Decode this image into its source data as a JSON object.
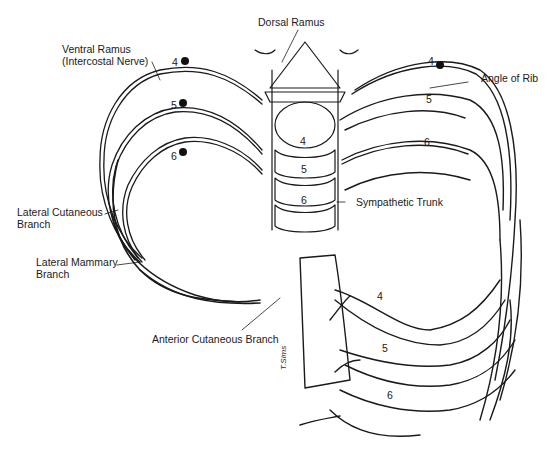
{
  "diagram": {
    "labels": {
      "dorsal_ramus": "Dorsal Ramus",
      "ventral_ramus_line1": "Ventral Ramus",
      "ventral_ramus_line2": "(Intercostal Nerve)",
      "angle_of_rib": "Angle of Rib",
      "sympathetic_trunk": "Sympathetic Trunk",
      "lateral_cutaneous_line1": "Lateral Cutaneous",
      "lateral_cutaneous_line2": "Branch",
      "lateral_mammary_line1": "Lateral Mammary",
      "lateral_mammary_line2": "Branch",
      "anterior_cutaneous": "Anterior Cutaneous Branch"
    },
    "left_nerve_markers": [
      "4",
      "5",
      "6"
    ],
    "right_nerve_marker": "4",
    "right_rib_numbers": [
      "5",
      "6"
    ],
    "vertebra_numbers": [
      "4",
      "5",
      "6"
    ],
    "anterior_rib_numbers": [
      "4",
      "5",
      "6"
    ],
    "signature": "T.Sims",
    "colors": {
      "ink": "#1a1a1a",
      "background": "#ffffff"
    }
  }
}
